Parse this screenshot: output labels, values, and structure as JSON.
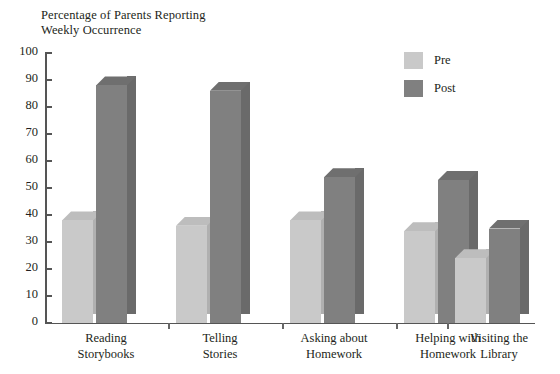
{
  "chart_data": {
    "type": "bar",
    "title": "Percentage of Parents Reporting\nWeekly Occurrence",
    "xlabel": "",
    "ylabel": "Percentage of Parents Reporting Weekly Occurrence",
    "ylim": [
      0,
      100
    ],
    "ytick_step": 10,
    "grid": false,
    "legend_position": "top-right",
    "style": "3d-bars",
    "categories": [
      "Reading\nStorybooks",
      "Telling\nStories",
      "Asking about\nHomework",
      "Helping with\nHomework",
      "Visiting the\nLibrary"
    ],
    "ytick_labels": [
      "0",
      "10",
      "20",
      "30",
      "40",
      "50",
      "60",
      "70",
      "80",
      "90",
      "100"
    ],
    "series": [
      {
        "name": "Pre",
        "color": "#c9c9c9",
        "values": [
          38,
          36,
          38,
          34,
          24
        ]
      },
      {
        "name": "Post",
        "color": "#808080",
        "values": [
          88,
          86,
          54,
          53,
          35
        ]
      }
    ]
  },
  "legend": {
    "items": [
      {
        "label": "Pre",
        "swatch": "#c9c9c9"
      },
      {
        "label": "Post",
        "swatch": "#808080"
      }
    ]
  }
}
